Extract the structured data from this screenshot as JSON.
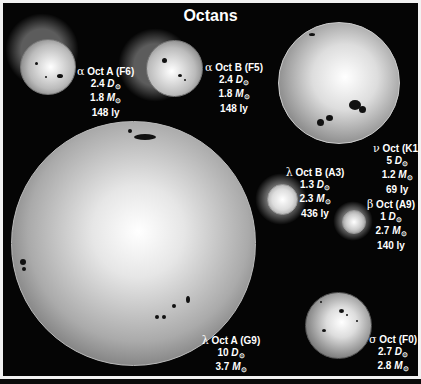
{
  "title": "Octans",
  "sun_symbol": "⊙",
  "stars": [
    {
      "id": "alpha-oct-a",
      "symbol": "α",
      "name": "Oct A (F6)",
      "diameter": "2.4",
      "mass": "1.8",
      "distance": "148 ly"
    },
    {
      "id": "alpha-oct-b",
      "symbol": "α",
      "name": "Oct B (F5)",
      "diameter": "2.4",
      "mass": "1.8",
      "distance": "148 ly"
    },
    {
      "id": "nu-oct",
      "symbol": "ν",
      "name": "Oct (K1)",
      "diameter": "5",
      "mass": "1.2",
      "distance": "69 ly"
    },
    {
      "id": "lambda-oct-b",
      "symbol": "λ",
      "name": "Oct B (A3)",
      "diameter": "1.3",
      "mass": "2.3",
      "distance": "436 ly"
    },
    {
      "id": "beta-oct",
      "symbol": "β",
      "name": "Oct (A9)",
      "diameter": "1",
      "mass": "2.7",
      "distance": "140 ly"
    },
    {
      "id": "lambda-oct-a",
      "symbol": "λ",
      "name": "Oct A (G9)",
      "diameter": "10",
      "mass": "3.7",
      "distance": "436 ly"
    },
    {
      "id": "sigma-oct",
      "symbol": "σ",
      "name": "Oct (F0)",
      "diameter": "2.7",
      "mass": "2.8",
      "distance": "270 ly"
    }
  ],
  "units": {
    "diameter": "D",
    "mass": "M"
  }
}
